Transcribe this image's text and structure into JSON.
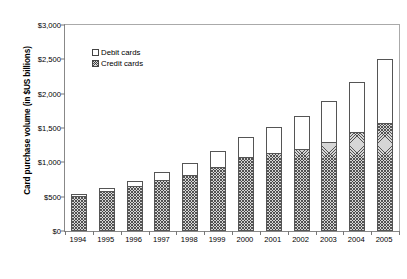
{
  "chart_data": {
    "type": "bar",
    "subtype": "stacked-vertical",
    "title": "",
    "xlabel": "",
    "ylabel": "Card purchase volume (in $US billions)",
    "categories": [
      "1994",
      "1995",
      "1996",
      "1997",
      "1998",
      "1999",
      "2000",
      "2001",
      "2002",
      "2003",
      "2004",
      "2005"
    ],
    "series": [
      {
        "name": "Credit cards",
        "swatch": "hatched",
        "color": "#d6d6d6",
        "values": [
          510,
          580,
          655,
          740,
          815,
          930,
          1075,
          1130,
          1200,
          1295,
          1440,
          1580
        ]
      },
      {
        "name": "Debit cards",
        "swatch": "white",
        "color": "#ffffff",
        "values": [
          25,
          45,
          70,
          115,
          175,
          235,
          300,
          385,
          480,
          595,
          735,
          930
        ]
      }
    ],
    "totals": [
      535,
      625,
      725,
      855,
      990,
      1165,
      1375,
      1515,
      1680,
      1890,
      2175,
      2510
    ],
    "ylim": [
      0,
      3000
    ],
    "ytick_values": [
      0,
      500,
      1000,
      1500,
      2000,
      2500,
      3000
    ],
    "ytick_labels": [
      "$0",
      "$500",
      "$1,000",
      "$1,500",
      "$2,000",
      "$2,500",
      "$3,000"
    ],
    "grid": false,
    "legend_position": "upper-left-inside",
    "legend_entries": [
      "Debit cards",
      "Credit cards"
    ]
  },
  "axes": {
    "y_title": "Card purchase volume (in $US billions)"
  },
  "legend": {
    "debit_label": "Debit cards",
    "credit_label": "Credit cards"
  },
  "caption": {
    "text": ""
  }
}
